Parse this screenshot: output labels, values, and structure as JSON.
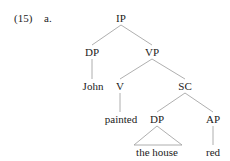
{
  "example": {
    "number": "(15)",
    "sub": "a."
  },
  "tree": {
    "nodes": [
      {
        "id": "ip",
        "label": "IP",
        "x": 121,
        "y": 18
      },
      {
        "id": "dp1",
        "label": "DP",
        "x": 92,
        "y": 52
      },
      {
        "id": "vp",
        "label": "VP",
        "x": 152,
        "y": 52
      },
      {
        "id": "john",
        "label": "John",
        "x": 93,
        "y": 86
      },
      {
        "id": "v",
        "label": "V",
        "x": 120,
        "y": 86
      },
      {
        "id": "sc",
        "label": "SC",
        "x": 185,
        "y": 86
      },
      {
        "id": "painted",
        "label": "painted",
        "x": 121,
        "y": 119
      },
      {
        "id": "dp2",
        "label": "DP",
        "x": 157,
        "y": 119
      },
      {
        "id": "ap",
        "label": "AP",
        "x": 213,
        "y": 119
      },
      {
        "id": "thehouse",
        "label": "the house",
        "x": 157,
        "y": 152
      },
      {
        "id": "red",
        "label": "red",
        "x": 213,
        "y": 152
      }
    ]
  }
}
